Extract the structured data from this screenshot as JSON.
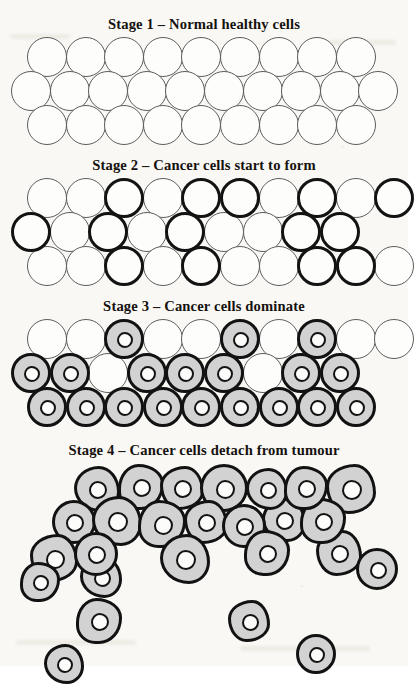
{
  "document": {
    "kind": "cancer-progression-diagram",
    "background_color": "#f9f8f5"
  },
  "palette": {
    "normal_cell_fill": "#fdfdfb",
    "normal_cell_stroke": "#5c5c5c",
    "cancer_cell_fill": "#d2d2d2",
    "cancer_cell_stroke": "#121212",
    "nucleus_fill": "#fcfcfa",
    "nucleus_stroke": "#131313",
    "title_color": "#15110e"
  },
  "stages": [
    {
      "id": "stage-1",
      "title": "Stage 1 – Normal healthy cells",
      "description": "Regular hexagonally packed sheet of normal cells, all thin-outlined and empty.",
      "rows": [
        {
          "count": 9,
          "type": "normal",
          "offset": 16
        },
        {
          "count": 10,
          "type": "normal",
          "offset": 0
        },
        {
          "count": 9,
          "type": "normal",
          "offset": 16
        }
      ]
    },
    {
      "id": "stage-2",
      "title": "Stage 2 – Cancer cells start to form",
      "description": "Same packed sheet; a scattered minority of cells now have thick dark outlines.",
      "rows": [
        {
          "count": 10,
          "cancer_indices": [
            2,
            4,
            5,
            7,
            9
          ]
        },
        {
          "count": 9,
          "cancer_indices": [
            0,
            2,
            4,
            7,
            8
          ]
        },
        {
          "count": 10,
          "cancer_indices": [
            2,
            4,
            7,
            8
          ]
        }
      ]
    },
    {
      "id": "stage-3",
      "title": "Stage 3 – Cancer cells dominate",
      "description": "Most cells are now grey cancer cells with dark nuclei; only a few pale normal cells remain, mainly in the top row.",
      "rows": [
        {
          "count": 10,
          "cancer_indices": [
            2,
            5,
            7
          ]
        },
        {
          "count": 9,
          "cancer_indices": [
            0,
            1,
            3,
            4,
            5,
            7,
            8
          ]
        },
        {
          "count": 9,
          "cancer_indices": [
            0,
            1,
            2,
            3,
            4,
            5,
            6,
            7,
            8
          ]
        }
      ]
    },
    {
      "id": "stage-4",
      "title": "Stage 4 – Cancer cells detach from tumour",
      "description": "A disordered mass of grey cancer cells with several individual cells breaking away and drifting below the tumour.",
      "cluster_count": 22,
      "detached_count": 5
    }
  ],
  "legend": {
    "normal_cell_label": "normal cell",
    "cancer_cell_label": "cancer cell",
    "nucleus_label": "nucleus"
  }
}
